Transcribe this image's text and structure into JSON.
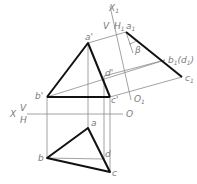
{
  "diagram": {
    "type": "descriptive-geometry-projection",
    "colors": {
      "thick_line": "#111111",
      "thin_line": "#8a8a8a",
      "label": "#7a7a7a"
    },
    "axes": {
      "main": {
        "label_left": "X",
        "upper": "V",
        "lower": "H",
        "origin": "O"
      },
      "auxiliary": {
        "label_top": "X",
        "label_top_sub": "1",
        "left": "V",
        "right": "H",
        "right_sub": "1",
        "origin": "O",
        "origin_sub": "1"
      }
    },
    "points": {
      "front": {
        "a": "a'",
        "b": "b'",
        "c": "c'",
        "d": "d'"
      },
      "top": {
        "a": "a",
        "b": "b",
        "c": "c",
        "d": "d"
      },
      "aux": {
        "a": "a",
        "a_sub": "1",
        "b": "b",
        "b_sub": "1",
        "d_paren_open": "(d",
        "d_sub": "1",
        "d_paren_close": ")",
        "c": "c",
        "c_sub": "1"
      },
      "angle": "β"
    }
  }
}
